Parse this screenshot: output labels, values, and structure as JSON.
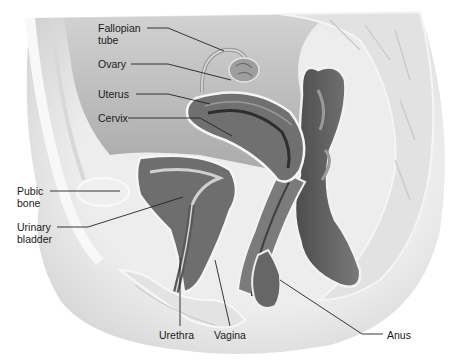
{
  "figure": {
    "type": "anatomical-illustration"
  },
  "labels": [
    {
      "id": "fallopian-tube",
      "lines": [
        "Fallopian",
        "tube"
      ],
      "x": 98,
      "y": 22
    },
    {
      "id": "ovary",
      "lines": [
        "Ovary"
      ],
      "x": 98,
      "y": 58
    },
    {
      "id": "uterus",
      "lines": [
        "Uterus"
      ],
      "x": 98,
      "y": 88
    },
    {
      "id": "cervix",
      "lines": [
        "Cervix"
      ],
      "x": 98,
      "y": 112
    },
    {
      "id": "pubic-bone",
      "lines": [
        "Pubic",
        "bone"
      ],
      "x": 17,
      "y": 185
    },
    {
      "id": "urinary-bladder",
      "lines": [
        "Urinary",
        "bladder"
      ],
      "x": 17,
      "y": 221
    },
    {
      "id": "urethra",
      "lines": [
        "Urethra"
      ],
      "x": 159,
      "y": 329
    },
    {
      "id": "vagina",
      "lines": [
        "Vagina"
      ],
      "x": 214,
      "y": 329
    },
    {
      "id": "anus",
      "lines": [
        "Anus"
      ],
      "x": 387,
      "y": 329
    }
  ],
  "colors": {
    "background": "#ffffff",
    "body_fill": "#ececec",
    "cavity": "#bdbdbd",
    "organ_dark": "#6a6a6a",
    "organ_mid": "#8c8c8c",
    "organ_light": "#d6d6d6",
    "outline": "#f7f7f7",
    "leader": "#222222",
    "text": "#1a1a1a"
  }
}
